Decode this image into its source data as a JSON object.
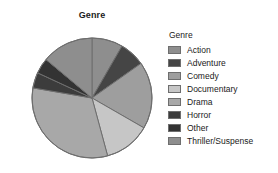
{
  "chart": {
    "title": "Genre"
  },
  "legend": {
    "title": "Genre"
  },
  "chart_data": {
    "type": "pie",
    "title": "Genre",
    "xlabel": "",
    "ylabel": "",
    "grid": false,
    "legend_position": "right",
    "legend_title": "Genre",
    "start_angle_deg": 0,
    "direction": "clockwise",
    "categories": [
      "Action",
      "Adventure",
      "Comedy",
      "Documentary",
      "Drama",
      "Horror",
      "Other",
      "Thriller/Suspense"
    ],
    "values": [
      8.3,
      6.9,
      18.1,
      12.5,
      31.9,
      4.2,
      4.2,
      13.9
    ],
    "unit": "percent",
    "slices": [
      {
        "label": "Action",
        "value": 8.3,
        "start_deg": 0,
        "end_deg": 30,
        "color": "#8e8e8e"
      },
      {
        "label": "Adventure",
        "value": 6.9,
        "start_deg": 30,
        "end_deg": 54.8,
        "color": "#454545"
      },
      {
        "label": "Comedy",
        "value": 18.1,
        "start_deg": 54.8,
        "end_deg": 119.9,
        "color": "#9e9e9e"
      },
      {
        "label": "Documentary",
        "value": 12.5,
        "start_deg": 119.9,
        "end_deg": 164.9,
        "color": "#c6c6c6"
      },
      {
        "label": "Drama",
        "value": 31.9,
        "start_deg": 164.9,
        "end_deg": 279.7,
        "color": "#a8a8a8"
      },
      {
        "label": "Horror",
        "value": 4.2,
        "start_deg": 279.7,
        "end_deg": 294.8,
        "color": "#3c3c3c"
      },
      {
        "label": "Other",
        "value": 4.2,
        "start_deg": 294.8,
        "end_deg": 309.9,
        "color": "#333333"
      },
      {
        "label": "Thriller/Suspense",
        "value": 13.9,
        "start_deg": 309.9,
        "end_deg": 360,
        "color": "#8e8e8e"
      }
    ]
  },
  "style": {
    "slice_outline": "#6e6e6e",
    "text_color": "#1a1a1a",
    "background": "#ffffff"
  }
}
